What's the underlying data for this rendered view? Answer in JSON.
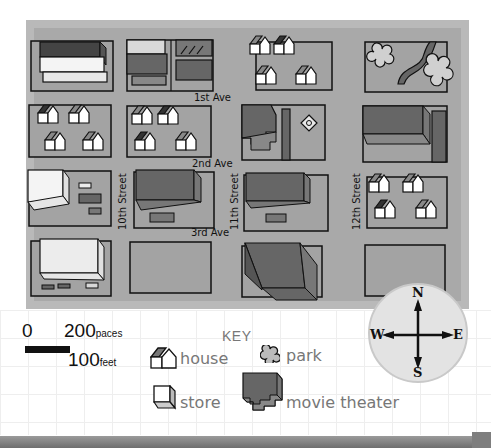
{
  "map": {
    "streets": {
      "avenues": [
        "1st Ave",
        "2nd Ave",
        "3rd Ave"
      ],
      "cross_streets": [
        "10th Street",
        "11th Street",
        "12th Street"
      ]
    },
    "blocks": [
      {
        "row": 1,
        "col": 1,
        "contents": "two long stores (one dark, one white)"
      },
      {
        "row": 1,
        "col": 2,
        "contents": "stores / buildings with parking"
      },
      {
        "row": 1,
        "col": 3,
        "contents": "4 houses"
      },
      {
        "row": 1,
        "col": 4,
        "contents": "park with path and 2 trees"
      },
      {
        "row": 2,
        "col": 1,
        "contents": "4 houses"
      },
      {
        "row": 2,
        "col": 2,
        "contents": "5 houses"
      },
      {
        "row": 2,
        "col": 3,
        "contents": "movie theater with sign"
      },
      {
        "row": 2,
        "col": 4,
        "contents": "store with parking"
      },
      {
        "row": 3,
        "col": 1,
        "contents": "white store with parked cars"
      },
      {
        "row": 3,
        "col": 2,
        "contents": "dark store with parked car"
      },
      {
        "row": 3,
        "col": 3,
        "contents": "dark store with parked car"
      },
      {
        "row": 3,
        "col": 4,
        "contents": "4 houses"
      },
      {
        "row": 4,
        "col": 1,
        "contents": "white store with parked cars"
      },
      {
        "row": 4,
        "col": 2,
        "contents": "empty lot"
      },
      {
        "row": 4,
        "col": 3,
        "contents": "large dark store"
      },
      {
        "row": 4,
        "col": 4,
        "contents": "empty lot"
      }
    ],
    "colors": {
      "border": "#b9b9b9",
      "ground": "#a9a9a9",
      "lot": "#a3a3a3",
      "dark_building": "#555555",
      "mid_building": "#777777",
      "white_building": "#f4f4f4",
      "outline": "#111111"
    }
  },
  "scale": {
    "zero": "0",
    "paces_value": "200",
    "paces_unit": "paces",
    "feet_value": "100",
    "feet_unit": "feet"
  },
  "key": {
    "title": "KEY",
    "items": [
      {
        "icon": "house-icon",
        "label": "house"
      },
      {
        "icon": "park-icon",
        "label": "park"
      },
      {
        "icon": "store-icon",
        "label": "store"
      },
      {
        "icon": "movie-theater-icon",
        "label": "movie theater"
      }
    ]
  },
  "compass": {
    "north": "N",
    "south": "S",
    "east": "E",
    "west": "W"
  }
}
